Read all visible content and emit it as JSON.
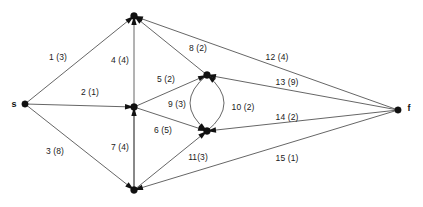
{
  "diagram": {
    "type": "directed-graph",
    "background_color": "#ffffff",
    "edge_color": "#555555",
    "node_color": "#111111",
    "nodes": [
      {
        "id": "s",
        "label": "s",
        "x": 25,
        "y": 104,
        "label_x": 14,
        "label_y": 104,
        "r": 3.2
      },
      {
        "id": "n_top",
        "label": "",
        "x": 134,
        "y": 16,
        "label_x": 134,
        "label_y": 8,
        "r": 3.4
      },
      {
        "id": "n_center",
        "label": "",
        "x": 134,
        "y": 107,
        "label_x": 134,
        "label_y": 99,
        "r": 3.4
      },
      {
        "id": "n_ur",
        "label": "",
        "x": 207,
        "y": 75,
        "label_x": 207,
        "label_y": 67,
        "r": 3.4
      },
      {
        "id": "n_lr",
        "label": "",
        "x": 207,
        "y": 131,
        "label_x": 207,
        "label_y": 123,
        "r": 3.4
      },
      {
        "id": "n_bottom",
        "label": "",
        "x": 134,
        "y": 190,
        "label_x": 134,
        "label_y": 182,
        "r": 3.4
      },
      {
        "id": "f",
        "label": "f",
        "x": 398,
        "y": 110,
        "label_x": 409,
        "label_y": 108,
        "r": 3.2
      }
    ],
    "edges": [
      {
        "id": "e1",
        "label": "1 (3)",
        "from": "s",
        "to": "n_top",
        "index": 1,
        "capacity": 3,
        "label_x": 58,
        "label_y": 57,
        "shape": "line"
      },
      {
        "id": "e2",
        "label": "2 (1)",
        "from": "s",
        "to": "n_center",
        "index": 2,
        "capacity": 1,
        "label_x": 90,
        "label_y": 92,
        "shape": "line"
      },
      {
        "id": "e3",
        "label": "3 (8)",
        "from": "s",
        "to": "n_bottom",
        "index": 3,
        "capacity": 8,
        "label_x": 55,
        "label_y": 151,
        "shape": "line"
      },
      {
        "id": "e4",
        "label": "4 (4)",
        "from": "n_bottom",
        "to": "n_top",
        "index": 4,
        "capacity": 4,
        "label_x": 120,
        "label_y": 60,
        "shape": "line"
      },
      {
        "id": "e5",
        "label": "5 (2)",
        "from": "n_center",
        "to": "n_ur",
        "index": 5,
        "capacity": 2,
        "label_x": 166,
        "label_y": 79,
        "shape": "line"
      },
      {
        "id": "e6",
        "label": "6 (5)",
        "from": "n_center",
        "to": "n_lr",
        "index": 6,
        "capacity": 5,
        "label_x": 163,
        "label_y": 130,
        "shape": "line"
      },
      {
        "id": "e7",
        "label": "7 (4)",
        "from": "n_bottom",
        "to": "n_center",
        "index": 7,
        "capacity": 4,
        "label_x": 120,
        "label_y": 147,
        "shape": "line"
      },
      {
        "id": "e8",
        "label": "8 (2)",
        "from": "n_ur",
        "to": "n_top",
        "index": 8,
        "capacity": 2,
        "label_x": 198,
        "label_y": 48,
        "shape": "line"
      },
      {
        "id": "e9",
        "label": "9 (3)",
        "from": "n_ur",
        "to": "n_lr",
        "index": 9,
        "capacity": 3,
        "label_x": 177,
        "label_y": 104,
        "shape": "curve-left"
      },
      {
        "id": "e10",
        "label": "10 (2)",
        "from": "n_lr",
        "to": "n_ur",
        "index": 10,
        "capacity": 2,
        "label_x": 243,
        "label_y": 107,
        "shape": "curve-right"
      },
      {
        "id": "e11",
        "label": "11(3)",
        "from": "n_bottom",
        "to": "n_lr",
        "index": 11,
        "capacity": 3,
        "label_x": 198,
        "label_y": 157,
        "shape": "line"
      },
      {
        "id": "e12",
        "label": "12 (4)",
        "from": "f",
        "to": "n_top",
        "index": 12,
        "capacity": 4,
        "label_x": 277,
        "label_y": 57,
        "shape": "line"
      },
      {
        "id": "e13",
        "label": "13 (9)",
        "from": "f",
        "to": "n_ur",
        "index": 13,
        "capacity": 9,
        "label_x": 287,
        "label_y": 82,
        "shape": "line"
      },
      {
        "id": "e14",
        "label": "14 (2)",
        "from": "f",
        "to": "n_lr",
        "index": 14,
        "capacity": 2,
        "label_x": 287,
        "label_y": 117,
        "shape": "line"
      },
      {
        "id": "e15",
        "label": "15 (1)",
        "from": "f",
        "to": "n_bottom",
        "index": 15,
        "capacity": 1,
        "label_x": 287,
        "label_y": 158,
        "shape": "line"
      }
    ]
  }
}
